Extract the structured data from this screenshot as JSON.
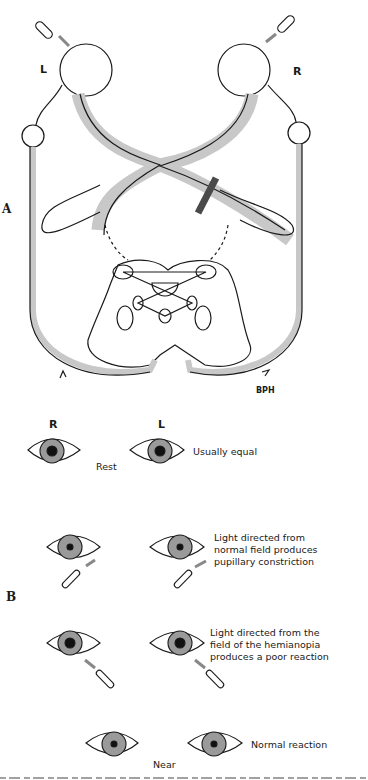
{
  "panel_a": {
    "label": "A",
    "eye_left_label": "L",
    "eye_right_label": "R",
    "lesion": "optic-tract-lesion-right",
    "signature": "BPH"
  },
  "panel_b": {
    "label": "B",
    "column_labels": [
      "R",
      "L"
    ],
    "rows": [
      {
        "state": "Rest",
        "note": "Usually equal"
      },
      {
        "state": "",
        "note": "Light directed from normal field produces pupillary constriction"
      },
      {
        "state": "",
        "note": "Light directed from the field of the hemianopia produces a poor reaction"
      },
      {
        "state": "Near",
        "note": "Normal reaction"
      }
    ]
  },
  "colors": {
    "pathway": "#c8c8c8",
    "line": "#1a1a1a",
    "lesion": "#4a4a4a",
    "iris": "#9a9a9a"
  }
}
